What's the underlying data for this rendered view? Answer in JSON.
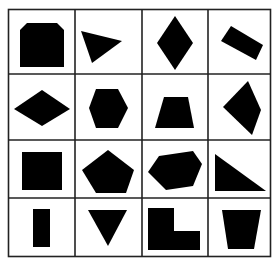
{
  "puzzle": {
    "rows": 4,
    "cols": 4,
    "line_color": "#222222",
    "fill_color": "#000000",
    "background": "#ffffff",
    "cells": [
      {
        "row": 0,
        "col": 0,
        "shape": "clipped-corner-square"
      },
      {
        "row": 0,
        "col": 1,
        "shape": "triangle"
      },
      {
        "row": 0,
        "col": 2,
        "shape": "rhombus-vertical"
      },
      {
        "row": 0,
        "col": 3,
        "shape": "tilted-rectangle"
      },
      {
        "row": 1,
        "col": 0,
        "shape": "rhombus-horizontal"
      },
      {
        "row": 1,
        "col": 1,
        "shape": "hexagon"
      },
      {
        "row": 1,
        "col": 2,
        "shape": "trapezoid"
      },
      {
        "row": 1,
        "col": 3,
        "shape": "irregular-quadrilateral"
      },
      {
        "row": 2,
        "col": 0,
        "shape": "square"
      },
      {
        "row": 2,
        "col": 1,
        "shape": "pentagon"
      },
      {
        "row": 2,
        "col": 2,
        "shape": "irregular-hexagon"
      },
      {
        "row": 2,
        "col": 3,
        "shape": "right-triangle"
      },
      {
        "row": 3,
        "col": 0,
        "shape": "narrow-rectangle"
      },
      {
        "row": 3,
        "col": 1,
        "shape": "inverted-triangle"
      },
      {
        "row": 3,
        "col": 2,
        "shape": "l-shape"
      },
      {
        "row": 3,
        "col": 3,
        "shape": "inverted-trapezoid"
      }
    ]
  }
}
